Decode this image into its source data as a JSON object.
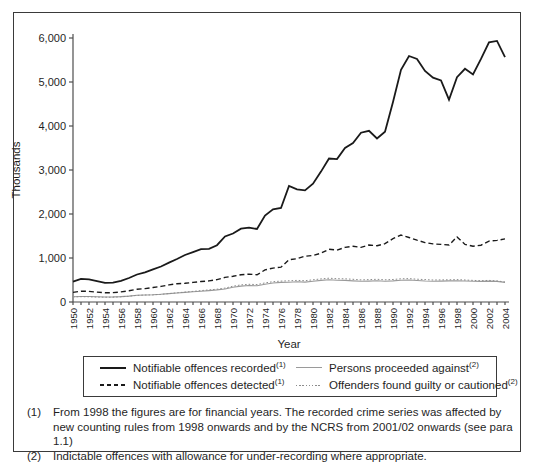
{
  "figure": {
    "background": "#ffffff",
    "border_color": "#3a3a3a",
    "text_color": "#1f1f1f",
    "axis_color": "#4d4d4d"
  },
  "chart_data": {
    "type": "line",
    "title": "",
    "xlabel": "Year",
    "ylabel": "Thousands",
    "ylim": [
      0,
      6000
    ],
    "ytick_step": 1000,
    "ytick_labels": [
      "0",
      "1,000",
      "2,000",
      "3,000",
      "4,000",
      "5,000",
      "6,000"
    ],
    "xtick_label_every": 2,
    "grid": false,
    "legend_position": "bottom",
    "x": [
      1950,
      1951,
      1952,
      1953,
      1954,
      1955,
      1956,
      1957,
      1958,
      1959,
      1960,
      1961,
      1962,
      1963,
      1964,
      1965,
      1966,
      1967,
      1968,
      1969,
      1970,
      1971,
      1972,
      1973,
      1974,
      1975,
      1976,
      1977,
      1978,
      1979,
      1980,
      1981,
      1982,
      1983,
      1984,
      1985,
      1986,
      1987,
      1988,
      1989,
      1990,
      1991,
      1992,
      1993,
      1994,
      1995,
      1996,
      1997,
      1998,
      1999,
      2000,
      2001,
      2002,
      2003,
      2004
    ],
    "series": [
      {
        "name": "Notifiable offences recorded",
        "footnote": "(1)",
        "style": "solid-thick",
        "color": "#1a1a1a",
        "values": [
          461,
          525,
          514,
          475,
          434,
          438,
          480,
          545,
          626,
          675,
          744,
          807,
          896,
          978,
          1068,
          1134,
          1200,
          1208,
          1290,
          1489,
          1556,
          1666,
          1690,
          1658,
          1963,
          2106,
          2136,
          2637,
          2561,
          2537,
          2688,
          2964,
          3262,
          3247,
          3499,
          3612,
          3847,
          3892,
          3716,
          3871,
          4544,
          5276,
          5592,
          5526,
          5253,
          5100,
          5037,
          4598,
          5109,
          5301,
          5171,
          5525,
          5899,
          5935,
          5563
        ]
      },
      {
        "name": "Notifiable offences detected",
        "footnote": "(1)",
        "style": "dashed",
        "color": "#1a1a1a",
        "values": [
          218,
          246,
          240,
          226,
          210,
          213,
          230,
          255,
          288,
          305,
          329,
          355,
          388,
          415,
          426,
          445,
          465,
          480,
          510,
          560,
          583,
          620,
          635,
          618,
          730,
          770,
          790,
          960,
          985,
          1040,
          1056,
          1110,
          1200,
          1180,
          1240,
          1265,
          1240,
          1295,
          1280,
          1325,
          1442,
          1520,
          1465,
          1405,
          1350,
          1320,
          1310,
          1295,
          1480,
          1310,
          1265,
          1290,
          1385,
          1400,
          1435
        ]
      },
      {
        "name": "Persons proceeded against",
        "footnote": "(2)",
        "style": "solid-thin",
        "color": "#9a9a9a",
        "values": [
          121,
          126,
          124,
          118,
          113,
          115,
          122,
          135,
          152,
          160,
          164,
          175,
          190,
          205,
          218,
          232,
          246,
          260,
          275,
          295,
          335,
          362,
          375,
          368,
          405,
          432,
          445,
          450,
          458,
          452,
          472,
          490,
          505,
          495,
          492,
          480,
          470,
          475,
          482,
          472,
          480,
          495,
          500,
          488,
          478,
          472,
          475,
          480,
          485,
          478,
          472,
          468,
          475,
          468,
          445
        ]
      },
      {
        "name": "Offenders found guilty or cautioned",
        "footnote": "(2)",
        "style": "dotted",
        "color": "#8c8c8c",
        "values": [
          115,
          120,
          118,
          112,
          108,
          110,
          118,
          132,
          150,
          158,
          162,
          175,
          192,
          210,
          226,
          242,
          258,
          274,
          292,
          315,
          358,
          388,
          402,
          395,
          435,
          462,
          475,
          482,
          490,
          484,
          505,
          525,
          540,
          530,
          528,
          515,
          502,
          508,
          515,
          505,
          512,
          528,
          532,
          518,
          508,
          500,
          502,
          505,
          510,
          500,
          492,
          485,
          490,
          480,
          455
        ]
      }
    ]
  },
  "footnotes": {
    "items": [
      {
        "marker": "(1)",
        "text": "From 1998 the figures are for financial years. The recorded crime series was affected by new counting rules from 1998 onwards and by the NCRS from 2001/02 onwards (see para 1.1)"
      },
      {
        "marker": "(2)",
        "text": "Indictable offences with allowance for under-recording where appropriate."
      }
    ]
  }
}
